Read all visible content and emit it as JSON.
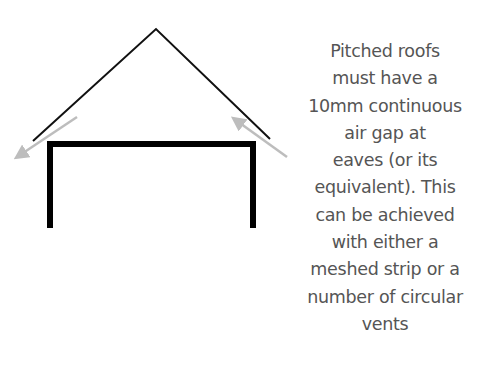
{
  "diagram": {
    "colors": {
      "roof": "#111111",
      "walls": "#000000",
      "airflow_arrows": "#bdbdbd",
      "text": "#555555",
      "background": "#ffffff"
    },
    "elements": {
      "roof": {
        "apex": [
          156,
          29
        ],
        "left_eave": [
          33,
          141
        ],
        "right_eave": [
          270,
          139
        ]
      },
      "walls": {
        "left_x": 50,
        "right_x": 253,
        "top_y": 144,
        "bottom_y": 228
      },
      "arrows": [
        {
          "name": "airflow-out-left",
          "from": [
            77,
            117
          ],
          "to": [
            13,
            160
          ]
        },
        {
          "name": "airflow-in-right",
          "from": [
            287,
            157
          ],
          "to": [
            230,
            116
          ]
        }
      ]
    },
    "caption_lines": [
      "Pitched roofs",
      "must have a",
      "10mm continuous",
      "air gap at",
      "eaves (or its",
      "equivalent). This",
      "can be achieved",
      "with either a",
      "meshed strip or a",
      "number of circular",
      "vents"
    ]
  }
}
